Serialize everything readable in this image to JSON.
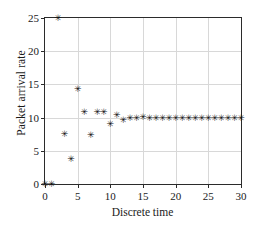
{
  "chart_data": {
    "type": "scatter",
    "title": "",
    "xlabel": "Discrete time",
    "ylabel": "Packet arrival rate",
    "xlim": [
      0,
      30
    ],
    "ylim": [
      0,
      25
    ],
    "xticks": [
      0,
      5,
      10,
      15,
      20,
      25,
      30
    ],
    "yticks": [
      0,
      5,
      10,
      15,
      20,
      25
    ],
    "xticklabels": [
      "0",
      "5",
      "10",
      "15",
      "20",
      "25",
      "30"
    ],
    "yticklabels": [
      "0",
      "5",
      "10",
      "15",
      "20",
      "25"
    ],
    "grid": true,
    "legend": false,
    "marker": "asterisk",
    "marker_color": "#111111",
    "series": [
      {
        "name": "Packet arrival rate",
        "x": [
          0,
          1,
          2,
          3,
          4,
          5,
          6,
          7,
          8,
          9,
          10,
          11,
          12,
          13,
          14,
          15,
          16,
          17,
          18,
          19,
          20,
          21,
          22,
          23,
          24,
          25,
          26,
          27,
          28,
          29,
          30
        ],
        "y": [
          0.0,
          0.0,
          24.9,
          7.5,
          3.7,
          14.3,
          10.8,
          7.3,
          10.7,
          10.8,
          9.0,
          10.3,
          9.6,
          9.8,
          9.8,
          10.0,
          9.8,
          9.8,
          9.8,
          9.8,
          9.8,
          9.8,
          9.8,
          9.8,
          9.8,
          9.8,
          9.8,
          9.8,
          9.8,
          9.8,
          9.8
        ]
      }
    ]
  }
}
